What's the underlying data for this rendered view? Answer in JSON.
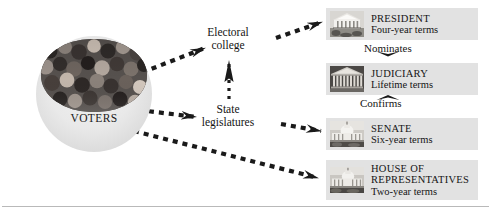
{
  "diagram": {
    "source_node": {
      "label": "VOTERS",
      "icon": "crowd-photo-icon"
    },
    "intermediate_nodes": [
      {
        "id": "electoral-college",
        "line1": "Electoral",
        "line2": "college"
      },
      {
        "id": "state-legislatures",
        "line1": "State",
        "line2": "legislatures"
      }
    ],
    "relation_labels": [
      {
        "id": "nominates",
        "text": "Nominates",
        "direction": "down"
      },
      {
        "id": "confirms",
        "text": "Confirms",
        "direction": "up"
      }
    ],
    "institutions": [
      {
        "id": "president",
        "name": "PRESIDENT",
        "term": "Four-year  terms",
        "icon": "white-house-icon"
      },
      {
        "id": "judiciary",
        "name": "JUDICIARY",
        "term": "Lifetime  terms",
        "icon": "supreme-court-icon"
      },
      {
        "id": "senate",
        "name": "SENATE",
        "term": "Six-year  terms",
        "icon": "capitol-icon"
      },
      {
        "id": "house",
        "name": "HOUSE  OF",
        "name2": "REPRESENTATIVES",
        "term": "Two-year  terms",
        "icon": "capitol-icon"
      }
    ],
    "colors": {
      "box_background": "#e2e2e2",
      "page_background": "#ffffff",
      "arrow": "#1a1a1a",
      "rule": "#b9b9b9",
      "text": "#141414"
    }
  }
}
